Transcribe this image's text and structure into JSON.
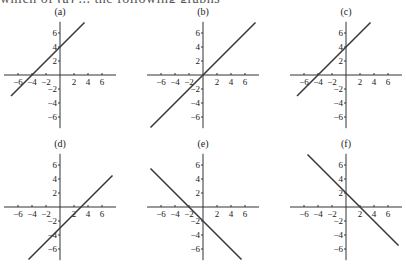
{
  "header": {
    "cut_text": "which of (a) ... the following graphs"
  },
  "chart_data": [
    {
      "type": "line",
      "title": "(a)",
      "equation": "y = x + 4",
      "slope": 1,
      "intercept": 4,
      "xlim": [
        -7,
        7
      ],
      "ylim": [
        -7,
        7
      ],
      "xticks": [
        -6,
        -4,
        -2,
        2,
        4,
        6
      ],
      "yticks": [
        6,
        4,
        2,
        -2,
        -4,
        -6
      ],
      "x": [
        -7,
        3.5
      ],
      "y": [
        -3,
        7.5
      ]
    },
    {
      "type": "line",
      "title": "(b)",
      "equation": "y = x",
      "slope": 1,
      "intercept": 0,
      "xlim": [
        -7,
        7
      ],
      "ylim": [
        -7,
        7
      ],
      "xticks": [
        -6,
        -4,
        -2,
        2,
        4,
        6
      ],
      "yticks": [
        6,
        4,
        2,
        -2,
        -4,
        -6
      ],
      "x": [
        -7.5,
        7.5
      ],
      "y": [
        -7.5,
        7.5
      ]
    },
    {
      "type": "line",
      "title": "(c)",
      "equation": "y = x + 4",
      "slope": 1,
      "intercept": 4,
      "xlim": [
        -7,
        7
      ],
      "ylim": [
        -7,
        7
      ],
      "xticks": [
        -6,
        -4,
        -2,
        2,
        4,
        6
      ],
      "yticks": [
        6,
        4,
        2,
        -2,
        -4,
        -6
      ],
      "x": [
        -7,
        3.5
      ],
      "y": [
        -3,
        7.5
      ]
    },
    {
      "type": "line",
      "title": "(d)",
      "equation": "y = x - 3",
      "slope": 1,
      "intercept": -3,
      "xlim": [
        -7,
        7
      ],
      "ylim": [
        -7,
        7
      ],
      "xticks": [
        -6,
        -4,
        -2,
        2,
        4,
        6
      ],
      "yticks": [
        6,
        4,
        2,
        -2,
        -4,
        -6
      ],
      "x": [
        -4.5,
        7.5
      ],
      "y": [
        -7.5,
        4.5
      ]
    },
    {
      "type": "line",
      "title": "(e)",
      "equation": "y = -x - 2",
      "slope": -1,
      "intercept": -2,
      "xlim": [
        -7,
        7
      ],
      "ylim": [
        -7,
        7
      ],
      "xticks": [
        -6,
        -4,
        -2,
        2,
        4,
        6
      ],
      "yticks": [
        6,
        4,
        2,
        -2,
        -4,
        -6
      ],
      "x": [
        -7.5,
        5.5
      ],
      "y": [
        5.5,
        -7.5
      ]
    },
    {
      "type": "line",
      "title": "(f)",
      "equation": "y = -x + 2",
      "slope": -1,
      "intercept": 2,
      "xlim": [
        -7,
        7
      ],
      "ylim": [
        -7,
        7
      ],
      "xticks": [
        -6,
        -4,
        -2,
        2,
        4,
        6
      ],
      "yticks": [
        6,
        4,
        2,
        -2,
        -4,
        -6
      ],
      "x": [
        -5.5,
        7.5
      ],
      "y": [
        7.5,
        -5.5
      ]
    }
  ],
  "layout": {
    "origins": [
      [
        60,
        75
      ],
      [
        203,
        75
      ],
      [
        346,
        75
      ],
      [
        60,
        207
      ],
      [
        203,
        207
      ],
      [
        346,
        207
      ]
    ],
    "unit_px": 7,
    "line_color": "#3a3a3a",
    "axis_color": "#333333"
  }
}
